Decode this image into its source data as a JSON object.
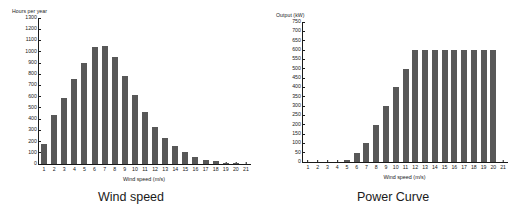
{
  "figure": {
    "panels": [
      {
        "id": "wind-speed-distribution",
        "caption": "Wind speed",
        "y_axis_title": "Hours per year",
        "x_axis_title": "Wind speed (m/s)"
      },
      {
        "id": "power-curve",
        "caption": "Power Curve",
        "y_axis_title": "Output (kW)",
        "x_axis_title": "Wind speed (m/s)"
      }
    ]
  },
  "colors": {
    "bar": "#585858",
    "axis": "#1a1a1a",
    "background": "#ffffff"
  },
  "chart_data": [
    {
      "type": "bar",
      "title": "Wind speed",
      "xlabel": "Wind speed (m/s)",
      "ylabel": "Hours per year",
      "categories": [
        "1",
        "2",
        "3",
        "4",
        "5",
        "6",
        "7",
        "8",
        "9",
        "10",
        "11",
        "12",
        "13",
        "14",
        "15",
        "16",
        "17",
        "18",
        "19",
        "20",
        "21"
      ],
      "values": [
        180,
        435,
        585,
        755,
        900,
        1040,
        1055,
        950,
        780,
        615,
        460,
        330,
        235,
        158,
        108,
        65,
        40,
        28,
        12,
        6,
        0
      ],
      "ylim": [
        0,
        1300
      ],
      "yticks": [
        0,
        100,
        200,
        300,
        400,
        500,
        600,
        700,
        800,
        900,
        1000,
        1100,
        1200,
        1300
      ],
      "grid": false,
      "legend": false
    },
    {
      "type": "bar",
      "title": "Power Curve",
      "xlabel": "Wind speed (m/s)",
      "ylabel": "Output (kW)",
      "categories": [
        "1",
        "2",
        "3",
        "4",
        "5",
        "6",
        "7",
        "8",
        "9",
        "10",
        "11",
        "12",
        "13",
        "14",
        "15",
        "16",
        "17",
        "18",
        "19",
        "20",
        "21"
      ],
      "values": [
        0,
        0,
        0,
        0,
        10,
        50,
        100,
        200,
        300,
        400,
        500,
        600,
        600,
        600,
        600,
        600,
        600,
        600,
        600,
        600,
        0
      ],
      "ylim": [
        0,
        750
      ],
      "yticks": [
        0,
        50,
        100,
        150,
        200,
        250,
        300,
        350,
        400,
        450,
        500,
        550,
        600,
        650,
        700,
        750
      ],
      "grid": false,
      "legend": false
    }
  ]
}
